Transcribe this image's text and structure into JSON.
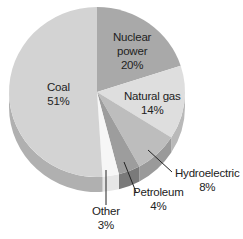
{
  "chart_data": {
    "type": "pie",
    "style": "3d",
    "title": "",
    "slices": [
      {
        "label": "Nuclear power",
        "label_lines": [
          "Nuclear",
          "power"
        ],
        "value": 20,
        "value_label": "20%",
        "color": "#a9a9a9",
        "side_color": "#8f8f8f"
      },
      {
        "label": "Natural gas",
        "label_lines": [
          "Natural gas"
        ],
        "value": 14,
        "value_label": "14%",
        "color": "#dedede",
        "side_color": "#b9b9b9"
      },
      {
        "label": "Hydroelectric",
        "label_lines": [
          "Hydroelectric"
        ],
        "value": 8,
        "value_label": "8%",
        "color": "#bdbdbd",
        "side_color": "#9a9a9a"
      },
      {
        "label": "Petroleum",
        "label_lines": [
          "Petroleum"
        ],
        "value": 4,
        "value_label": "4%",
        "color": "#9d9d9d",
        "side_color": "#7a7a7a"
      },
      {
        "label": "Other",
        "label_lines": [
          "Other"
        ],
        "value": 3,
        "value_label": "3%",
        "color": "#f6f6f6",
        "side_color": "#e6e6e6"
      },
      {
        "label": "Coal",
        "label_lines": [
          "Coal"
        ],
        "value": 51,
        "value_label": "51%",
        "color": "#d3d3d3",
        "side_color": "#b0b0b0"
      }
    ],
    "start_angle_deg": 0,
    "direction": "clockwise",
    "legend": "none",
    "labels_inside": [
      "Nuclear power",
      "Natural gas",
      "Coal"
    ],
    "labels_outside_with_leader": [
      "Hydroelectric",
      "Petroleum",
      "Other"
    ]
  }
}
